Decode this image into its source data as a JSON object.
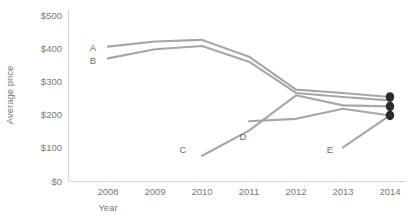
{
  "chart_data": {
    "type": "line",
    "title": "",
    "xlabel": "Year",
    "ylabel": "Average price",
    "x": [
      2008,
      2009,
      2010,
      2011,
      2012,
      2013,
      2014
    ],
    "xtick_labels": [
      "2008",
      "2009",
      "2010",
      "2011",
      "2012",
      "2013",
      "2014"
    ],
    "ytick_labels": [
      "$0",
      "$100",
      "$200",
      "$300",
      "$400",
      "$500"
    ],
    "ytick_values": [
      0,
      100,
      200,
      300,
      400,
      500
    ],
    "ylim": [
      0,
      500
    ],
    "xlim": [
      2008,
      2014
    ],
    "grid": false,
    "legend": "inline-labels",
    "line_color": "#a6a6a6",
    "endpoint_color": "#2b2b2b",
    "axis_color": "#d4d4d4",
    "text_color": "#7a7a7a",
    "series": [
      {
        "name": "A",
        "label": "A",
        "x": [
          2008,
          2009,
          2010,
          2011,
          2012,
          2013,
          2014
        ],
        "values": [
          400,
          415,
          420,
          370,
          272,
          262,
          250
        ],
        "endpoint_marker": true
      },
      {
        "name": "B",
        "label": "B",
        "x": [
          2008,
          2009,
          2010,
          2011,
          2012,
          2013,
          2014
        ],
        "values": [
          365,
          392,
          402,
          355,
          262,
          250,
          240
        ],
        "endpoint_marker": false
      },
      {
        "name": "C",
        "label": "C",
        "x": [
          2010,
          2011,
          2012,
          2013,
          2014
        ],
        "values": [
          75,
          150,
          255,
          225,
          222
        ],
        "endpoint_marker": true
      },
      {
        "name": "D",
        "label": "D",
        "x": [
          2011,
          2012,
          2013,
          2014
        ],
        "values": [
          178,
          185,
          215,
          195
        ],
        "endpoint_marker": true
      },
      {
        "name": "E",
        "label": "E",
        "x": [
          2013,
          2014
        ],
        "values": [
          100,
          195
        ],
        "endpoint_marker": false
      }
    ],
    "series_labels": [
      {
        "name": "A",
        "text": "A",
        "x": 93,
        "y": 51
      },
      {
        "name": "B",
        "text": "B",
        "x": 93,
        "y": 64
      },
      {
        "name": "C",
        "text": "C",
        "x": 183,
        "y": 153
      },
      {
        "name": "D",
        "text": "D",
        "x": 243,
        "y": 140
      },
      {
        "name": "E",
        "text": "E",
        "x": 330,
        "y": 153
      }
    ],
    "annotations": []
  }
}
